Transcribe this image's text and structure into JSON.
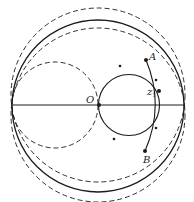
{
  "diagram": {
    "type": "geometric-figure",
    "labels": {
      "A": "A",
      "B": "B",
      "O": "O",
      "z1": "z",
      "z1_sub": "1"
    },
    "colors": {
      "stroke": "#1a1a1a",
      "background": "#ffffff"
    },
    "elements": [
      "outer unit circle (solid)",
      "horizontal diameter (solid)",
      "solid circle through O, A, z1, B with direction arrows",
      "solid arc through A, z1, B",
      "small dashed circle tangent at left",
      "upper large dashed circle",
      "lower large dashed circle"
    ]
  }
}
